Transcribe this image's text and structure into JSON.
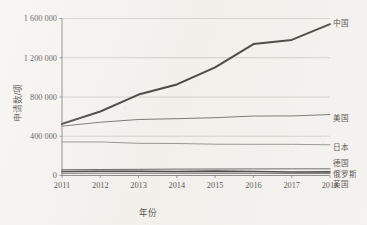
{
  "chart_data": {
    "type": "line",
    "title": "",
    "xlabel": "年份",
    "ylabel": "申请数/项",
    "x": [
      2011,
      2012,
      2013,
      2014,
      2015,
      2016,
      2017,
      2018
    ],
    "xtick_labels": [
      "2011",
      "2012",
      "2013",
      "2014",
      "2015",
      "2016",
      "2017",
      "2018"
    ],
    "ytick_labels": [
      "0",
      "400 000",
      "800 000",
      "1 200 000",
      "1 600 000"
    ],
    "ytick_values": [
      0,
      400000,
      800000,
      1200000,
      1600000
    ],
    "ylim": [
      0,
      1600000
    ],
    "xlim": [
      2011,
      2018
    ],
    "grid": "horizontal",
    "legend_position": "right-inline-labels",
    "series": [
      {
        "name": "中国",
        "color": "#16130f",
        "width": 2.0,
        "values": [
          526000,
          652000,
          825000,
          928000,
          1102000,
          1339000,
          1382000,
          1542000
        ]
      },
      {
        "name": "美国",
        "color": "#55524d",
        "width": 1.0,
        "values": [
          503000,
          543000,
          571000,
          579000,
          589000,
          606000,
          607000,
          621000
        ]
      },
      {
        "name": "日本",
        "color": "#6e6b66",
        "width": 0.9,
        "values": [
          342000,
          342000,
          328000,
          326000,
          319000,
          318000,
          318000,
          313000
        ]
      },
      {
        "name": "德国",
        "color": "#3b3935",
        "width": 1.0,
        "values": [
          59000,
          61000,
          63000,
          65000,
          66000,
          67000,
          68000,
          68000
        ]
      },
      {
        "name": "俄罗斯",
        "color": "#111111",
        "width": 1.6,
        "values": [
          41000,
          44000,
          44000,
          40000,
          45000,
          41000,
          36000,
          37000
        ]
      },
      {
        "name": "英国",
        "color": "#4f4d48",
        "width": 1.0,
        "values": [
          22000,
          23000,
          23000,
          23000,
          22000,
          22000,
          20000,
          20000
        ]
      }
    ]
  },
  "series_label_y_px": {
    "中国": 23,
    "美国": 118,
    "日本": 147,
    "德国": 163,
    "俄罗斯": 174,
    "英国": 184
  }
}
